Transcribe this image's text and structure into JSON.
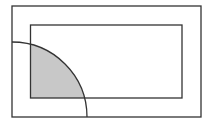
{
  "diagram": {
    "colors": {
      "background": "#ffffff",
      "stroke": "#333333",
      "shade": "#c8c8c8"
    },
    "outer_rect": {
      "x": 12,
      "y": 6,
      "width": 189,
      "height": 111
    },
    "inner_rect": {
      "x": 30.5,
      "y": 25,
      "width": 151.5,
      "height": 73
    },
    "arc": {
      "cx": 12,
      "cy": 117,
      "r": 75
    },
    "shaded_region": "intersection of quarter disk and inner rectangle"
  }
}
